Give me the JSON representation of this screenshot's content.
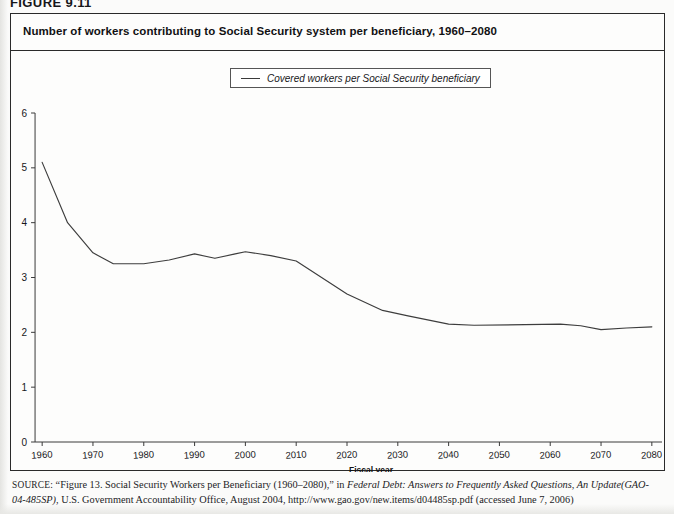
{
  "figure": {
    "label": "FIGURE 9.11",
    "title": "Number of workers contributing to Social Security system per beneficiary, 1960–2080"
  },
  "legend": {
    "entries": [
      {
        "label": "Covered workers per Social Security beneficiary",
        "color": "#3d3d3d"
      }
    ],
    "position": "top-center"
  },
  "source": {
    "prefix": "SOURCE:",
    "line1_a": "“Figure 13. Social Security Workers per Beneficiary (1960–2080),” in ",
    "line1_italic": "Federal Debt: Answers to Frequently Asked Questions, An Update",
    "line2_italic": "(GAO-04-485SP)",
    "line2_b": ", U.S. Government Accountability Office, August 2004, http://www.gao.gov/new.items/d04485sp.pdf (accessed June 7, 2006)"
  },
  "chart_data": {
    "type": "line",
    "title": "Number of workers contributing to Social Security system per beneficiary, 1960–2080",
    "xlabel": "Fiscal year",
    "ylabel": "",
    "xlim": [
      1958,
      2082
    ],
    "ylim": [
      0,
      6
    ],
    "grid": false,
    "xticks": [
      1960,
      1970,
      1980,
      1990,
      2000,
      2010,
      2020,
      2030,
      2040,
      2050,
      2060,
      2070,
      2080
    ],
    "xtick_labels": [
      "1960",
      "1970",
      "1980",
      "1990",
      "2000",
      "2010",
      "2020",
      "2030",
      "2040",
      "2050",
      "2060",
      "2070",
      "2080"
    ],
    "yticks": [
      0,
      1,
      2,
      3,
      4,
      5,
      6
    ],
    "ytick_labels": [
      "0",
      "1",
      "2",
      "3",
      "4",
      "5",
      "6"
    ],
    "series": [
      {
        "name": "Covered workers per Social Security beneficiary",
        "color": "#3d3d3d",
        "x": [
          1960,
          1965,
          1970,
          1974,
          1980,
          1985,
          1990,
          1994,
          1998,
          2000,
          2005,
          2010,
          2015,
          2020,
          2027,
          2032,
          2040,
          2045,
          2055,
          2062,
          2066,
          2070,
          2075,
          2080
        ],
        "y": [
          5.1,
          4.0,
          3.45,
          3.25,
          3.25,
          3.32,
          3.43,
          3.35,
          3.43,
          3.47,
          3.4,
          3.3,
          3.0,
          2.7,
          2.4,
          2.3,
          2.15,
          2.13,
          2.14,
          2.15,
          2.12,
          2.05,
          2.08,
          2.1
        ]
      }
    ]
  }
}
